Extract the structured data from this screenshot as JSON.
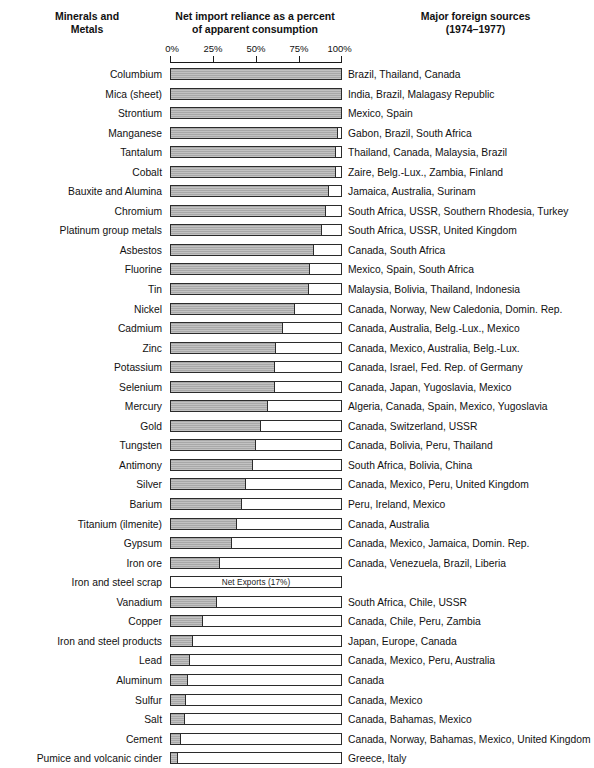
{
  "headers": {
    "left": "Minerals and\nMetals",
    "middle": "Net import reliance as a percent\nof apparent consumption",
    "right": "Major foreign sources\n(1974–1977)"
  },
  "axis": {
    "ticks": [
      "0%",
      "25%",
      "50%",
      "75%",
      "100%"
    ],
    "values": [
      0,
      25,
      50,
      75,
      100
    ],
    "min": 0,
    "max": 100
  },
  "colors": {
    "bar_fill": "#a8a8a8",
    "bar_border": "#2b2b2b",
    "background": "#ffffff",
    "text": "#111111"
  },
  "chart_data": {
    "type": "bar",
    "subtitle": "Major foreign sources (1974–1977)",
    "xlabel": "Net import reliance as a percent of apparent consumption",
    "ylabel": "Minerals and Metals",
    "xlim": [
      0,
      100
    ],
    "grid": false,
    "legend": null,
    "orientation": "horizontal",
    "tick_labels": [
      "0%",
      "25%",
      "50%",
      "75%",
      "100%"
    ],
    "categories": [
      "Columbium",
      "Mica (sheet)",
      "Strontium",
      "Manganese",
      "Tantalum",
      "Cobalt",
      "Bauxite and Alumina",
      "Chromium",
      "Platinum group metals",
      "Asbestos",
      "Fluorine",
      "Tin",
      "Nickel",
      "Cadmium",
      "Zinc",
      "Potassium",
      "Selenium",
      "Mercury",
      "Gold",
      "Tungsten",
      "Antimony",
      "Silver",
      "Barium",
      "Titanium (ilmenite)",
      "Gypsum",
      "Iron ore",
      "Iron and steel scrap",
      "Vanadium",
      "Copper",
      "Iron and steel products",
      "Lead",
      "Aluminum",
      "Sulfur",
      "Salt",
      "Cement",
      "Pumice and volcanic cinder"
    ],
    "values": [
      100,
      100,
      100,
      98,
      97,
      97,
      93,
      91,
      89,
      84,
      82,
      81,
      73,
      66,
      62,
      61,
      61,
      57,
      53,
      50,
      48,
      44,
      42,
      39,
      36,
      29,
      0,
      27,
      19,
      13,
      11,
      10,
      9,
      8,
      6,
      4
    ],
    "rows": [
      {
        "label": "Columbium",
        "value": 100,
        "sources": "Brazil, Thailand, Canada"
      },
      {
        "label": "Mica (sheet)",
        "value": 100,
        "sources": "India, Brazil, Malagasy Republic"
      },
      {
        "label": "Strontium",
        "value": 100,
        "sources": "Mexico, Spain"
      },
      {
        "label": "Manganese",
        "value": 98,
        "sources": "Gabon, Brazil, South Africa"
      },
      {
        "label": "Tantalum",
        "value": 97,
        "sources": "Thailand, Canada, Malaysia, Brazil"
      },
      {
        "label": "Cobalt",
        "value": 97,
        "sources": "Zaire, Belg.-Lux., Zambia, Finland"
      },
      {
        "label": "Bauxite and Alumina",
        "value": 93,
        "sources": "Jamaica, Australia, Surinam"
      },
      {
        "label": "Chromium",
        "value": 91,
        "sources": "South Africa, USSR, Southern Rhodesia, Turkey"
      },
      {
        "label": "Platinum group metals",
        "value": 89,
        "sources": "South Africa, USSR, United Kingdom"
      },
      {
        "label": "Asbestos",
        "value": 84,
        "sources": "Canada, South Africa"
      },
      {
        "label": "Fluorine",
        "value": 82,
        "sources": "Mexico, Spain, South Africa"
      },
      {
        "label": "Tin",
        "value": 81,
        "sources": "Malaysia, Bolivia, Thailand, Indonesia"
      },
      {
        "label": "Nickel",
        "value": 73,
        "sources": "Canada, Norway, New Caledonia, Domin. Rep."
      },
      {
        "label": "Cadmium",
        "value": 66,
        "sources": "Canada, Australia, Belg.-Lux., Mexico"
      },
      {
        "label": "Zinc",
        "value": 62,
        "sources": "Canada, Mexico, Australia, Belg.-Lux."
      },
      {
        "label": "Potassium",
        "value": 61,
        "sources": "Canada, Israel, Fed. Rep. of Germany"
      },
      {
        "label": "Selenium",
        "value": 61,
        "sources": "Canada, Japan, Yugoslavia, Mexico"
      },
      {
        "label": "Mercury",
        "value": 57,
        "sources": "Algeria, Canada, Spain, Mexico, Yugoslavia"
      },
      {
        "label": "Gold",
        "value": 53,
        "sources": "Canada, Switzerland, USSR"
      },
      {
        "label": "Tungsten",
        "value": 50,
        "sources": "Canada, Bolivia, Peru, Thailand"
      },
      {
        "label": "Antimony",
        "value": 48,
        "sources": "South Africa, Bolivia, China"
      },
      {
        "label": "Silver",
        "value": 44,
        "sources": "Canada, Mexico, Peru, United Kingdom"
      },
      {
        "label": "Barium",
        "value": 42,
        "sources": "Peru, Ireland, Mexico"
      },
      {
        "label": "Titanium (ilmenite)",
        "value": 39,
        "sources": "Canada, Australia"
      },
      {
        "label": "Gypsum",
        "value": 36,
        "sources": "Canada, Mexico, Jamaica, Domin. Rep."
      },
      {
        "label": "Iron ore",
        "value": 29,
        "sources": "Canada, Venezuela, Brazil, Liberia"
      },
      {
        "label": "Iron and steel scrap",
        "value": 0,
        "note": "Net Exports (17%)",
        "sources": ""
      },
      {
        "label": "Vanadium",
        "value": 27,
        "sources": "South Africa, Chile, USSR"
      },
      {
        "label": "Copper",
        "value": 19,
        "sources": "Canada, Chile, Peru, Zambia"
      },
      {
        "label": "Iron and steel products",
        "value": 13,
        "sources": "Japan, Europe, Canada"
      },
      {
        "label": "Lead",
        "value": 11,
        "sources": "Canada, Mexico, Peru, Australia"
      },
      {
        "label": "Aluminum",
        "value": 10,
        "sources": "Canada"
      },
      {
        "label": "Sulfur",
        "value": 9,
        "sources": "Canada, Mexico"
      },
      {
        "label": "Salt",
        "value": 8,
        "sources": "Canada, Bahamas, Mexico"
      },
      {
        "label": "Cement",
        "value": 6,
        "sources": "Canada, Norway, Bahamas, Mexico, United Kingdom"
      },
      {
        "label": "Pumice and volcanic cinder",
        "value": 4,
        "sources": "Greece, Italy"
      }
    ]
  }
}
